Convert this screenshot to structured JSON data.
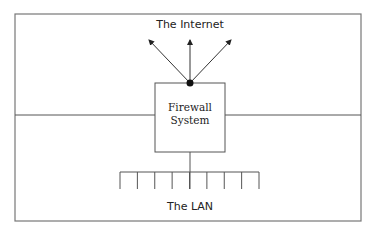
{
  "diagram": {
    "title_top": "The Internet",
    "firewall": {
      "line1": "Firewall",
      "line2": "System"
    },
    "title_bottom": "The LAN",
    "lan_hosts": 9,
    "internet_arrows": 3,
    "colors": {
      "line": "#555555",
      "node": "#111111",
      "background": "#ffffff"
    }
  }
}
